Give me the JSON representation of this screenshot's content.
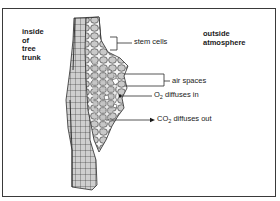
{
  "diagram": {
    "type": "labeled cross-section",
    "region_labels": {
      "inside": [
        "inside",
        "of",
        "tree",
        "trunk"
      ],
      "outside": [
        "outside",
        "atmosphere"
      ]
    },
    "callouts": {
      "stem_cells": "stem cells",
      "air_spaces": "air spaces",
      "o2": {
        "prefix": "O",
        "sub": "2",
        "suffix": " diffuses in"
      },
      "co2": {
        "prefix": "CO",
        "sub": "2",
        "suffix": " diffuses out"
      }
    },
    "colors": {
      "cell_fill": "#c9c9c9",
      "cell_stroke": "#2b2b2b",
      "line": "#2b2b2b",
      "frame": "#3a3a3a"
    }
  }
}
